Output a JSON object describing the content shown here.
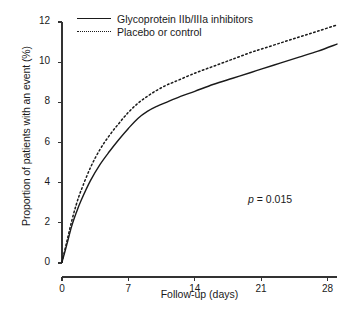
{
  "chart_data": {
    "type": "line",
    "title": "",
    "xlabel": "Follow-up (days)",
    "ylabel": "Proportion of patients with an event (%)",
    "xlim": [
      0,
      29
    ],
    "ylim": [
      0,
      12
    ],
    "xticks": [
      0,
      7,
      14,
      21,
      28
    ],
    "yticks": [
      0,
      2,
      4,
      6,
      8,
      10,
      12
    ],
    "xtick_labels": [
      "0",
      "7",
      "14",
      "21",
      "28"
    ],
    "ytick_labels": [
      "0",
      "2",
      "4",
      "6",
      "8",
      "10",
      "12"
    ],
    "grid": false,
    "legend_position": "top-left",
    "annotations": [
      {
        "name": "p-value",
        "text_italic": "p",
        "text_rest": " = 0.015",
        "x": 24.5,
        "y": 3.0
      }
    ],
    "x": [
      0,
      0.5,
      1,
      1.5,
      2,
      3,
      4,
      5,
      6,
      7,
      8,
      9,
      10,
      11,
      12,
      14,
      16,
      18,
      20,
      21,
      23,
      25,
      27,
      29
    ],
    "series": [
      {
        "name": "Glycoprotein IIb/IIIa inhibitors",
        "style": "solid",
        "color": "#1a1a1a",
        "values": [
          0.05,
          0.9,
          1.8,
          2.5,
          3.1,
          4.1,
          4.9,
          5.55,
          6.15,
          6.7,
          7.2,
          7.55,
          7.8,
          8.0,
          8.2,
          8.55,
          8.9,
          9.2,
          9.5,
          9.65,
          9.95,
          10.25,
          10.55,
          10.9
        ]
      },
      {
        "name": "Placebo or control",
        "style": "dotted",
        "color": "#1a1a1a",
        "values": [
          0.05,
          1.05,
          2.05,
          2.9,
          3.6,
          4.75,
          5.65,
          6.35,
          6.95,
          7.5,
          7.95,
          8.3,
          8.6,
          8.85,
          9.05,
          9.45,
          9.8,
          10.15,
          10.5,
          10.65,
          10.95,
          11.25,
          11.55,
          11.85
        ]
      }
    ]
  },
  "legend": {
    "items": [
      {
        "label": "Glycoprotein IIb/IIIa inhibitors",
        "style": "solid"
      },
      {
        "label": "Placebo or control",
        "style": "dotted"
      }
    ]
  },
  "axes": {
    "axis_color": "#333333"
  }
}
